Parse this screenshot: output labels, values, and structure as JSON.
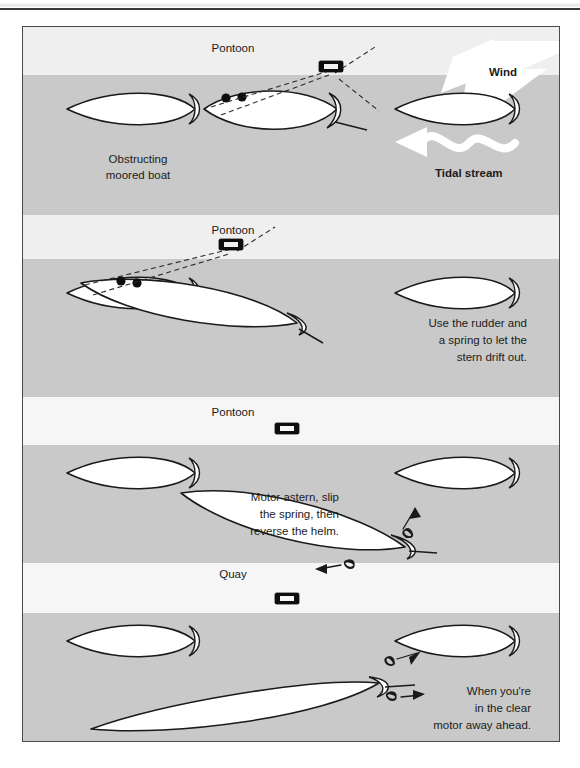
{
  "page": {
    "header_rule": true,
    "figure_title": "Leaving a berth with an obstructing moored boat"
  },
  "diagram": {
    "type": "boat-handling-sequence",
    "panel_count": 4,
    "colors": {
      "water_dark": "#c9c9c9",
      "water_light": "#efefef",
      "quay_light": "#f6f6f6",
      "hull_fill": "#ffffff",
      "outline": "#1a1a1a",
      "frame_border": "#4a4a4a"
    },
    "panels": [
      {
        "id": "panel-1",
        "structure_label": "Pontoon",
        "labels": [
          {
            "name": "obstructing-moored-boat-label",
            "text": "Obstructing\nmoored boat",
            "line1": "Obstructing",
            "line2": "moored boat",
            "align": "center"
          },
          {
            "name": "wind-label",
            "text": "Wind",
            "align": "left"
          },
          {
            "name": "tidal-stream-label",
            "text": "Tidal stream",
            "align": "left"
          }
        ],
        "arrows": [
          {
            "name": "wind-arrow",
            "kind": "block-arrow",
            "direction": "down-left",
            "color": "#ffffff"
          },
          {
            "name": "tidal-stream-arrow",
            "kind": "wavy-arrow",
            "direction": "left",
            "color": "#ffffff"
          }
        ],
        "boats": [
          {
            "name": "moored-boat-left",
            "heading": "level",
            "role": "obstructing moored boat"
          },
          {
            "name": "own-boat",
            "heading": "bow-up-slight",
            "role": "own boat alongside",
            "has_mooring_lines": true,
            "fenders": 2
          },
          {
            "name": "moored-boat-right",
            "heading": "level",
            "role": "moored boat"
          }
        ],
        "mooring": {
          "cleat": true,
          "line_count": 2,
          "style": "dashed"
        }
      },
      {
        "id": "panel-2",
        "structure_label": "Pontoon",
        "labels": [
          {
            "name": "panel-2-instruction",
            "line1": "Use the rudder and",
            "line2": "a spring to let the",
            "line3": "stern drift out.",
            "align": "right"
          }
        ],
        "boats": [
          {
            "name": "moored-boat-left",
            "heading": "level"
          },
          {
            "name": "own-boat",
            "heading": "bow-up-angled",
            "role": "stern drifting out",
            "has_mooring_lines": true,
            "fenders": 2
          },
          {
            "name": "moored-boat-right",
            "heading": "level"
          }
        ],
        "mooring": {
          "cleat": true,
          "line_count": 2,
          "style": "dashed"
        }
      },
      {
        "id": "panel-3",
        "structure_label": "Pontoon",
        "labels": [
          {
            "name": "panel-3-instruction",
            "line1": "Motor astern, slip",
            "line2": "the spring, then",
            "line3": "reverse the helm.",
            "align": "right"
          }
        ],
        "boats": [
          {
            "name": "moored-boat-left",
            "heading": "level"
          },
          {
            "name": "own-boat",
            "heading": "bow-up-steep",
            "role": "motoring astern"
          },
          {
            "name": "moored-boat-right",
            "heading": "level"
          }
        ],
        "arrows": [
          {
            "name": "prop-wash-arrow-upper",
            "kind": "coil-arrow",
            "direction": "up-right"
          },
          {
            "name": "prop-wash-arrow-lower",
            "kind": "coil-arrow",
            "direction": "left"
          }
        ],
        "mooring": {
          "cleat": true,
          "line_count": 0
        }
      },
      {
        "id": "panel-4",
        "structure_label": "Quay",
        "labels": [
          {
            "name": "panel-4-instruction",
            "line1": "When you're",
            "line2": "in the clear",
            "line3": "motor away ahead.",
            "align": "right"
          }
        ],
        "boats": [
          {
            "name": "moored-boat-left",
            "heading": "level"
          },
          {
            "name": "own-boat",
            "heading": "bow-up-shallow",
            "role": "motoring away ahead"
          },
          {
            "name": "moored-boat-right",
            "heading": "level"
          }
        ],
        "arrows": [
          {
            "name": "prop-wash-arrow-upper",
            "kind": "coil-arrow",
            "direction": "up-right"
          },
          {
            "name": "prop-wash-arrow-lower",
            "kind": "coil-arrow",
            "direction": "right"
          }
        ],
        "mooring": {
          "cleat": true,
          "line_count": 0
        }
      }
    ]
  }
}
